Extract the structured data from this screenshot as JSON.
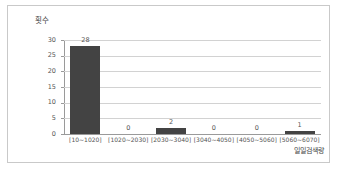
{
  "chart_data": {
    "type": "bar",
    "title": "",
    "xlabel": "일일검색량",
    "ylabel": "횟수",
    "categories": [
      "[10~1020]",
      "[1020~2030]",
      "[2030~3040]",
      "[3040~4050]",
      "[4050~5060]",
      "[5060~6070]"
    ],
    "values": [
      28,
      0,
      2,
      0,
      0,
      1
    ],
    "data_labels": [
      "28",
      "0",
      "2",
      "0",
      "0",
      "1"
    ],
    "ylim": [
      0,
      30
    ],
    "yticks": [
      30,
      25,
      20,
      15,
      10,
      5,
      0
    ],
    "ytick_labels": [
      "30",
      "25",
      "20",
      "15",
      "10",
      "5",
      "0"
    ],
    "grid": true,
    "legend": false,
    "colors": {
      "bar": "#434343",
      "grid": "#d2d2d2",
      "axis": "#9a9a9a",
      "text": "#555555",
      "border": "#c9c9c9",
      "background": "#ffffff"
    }
  }
}
